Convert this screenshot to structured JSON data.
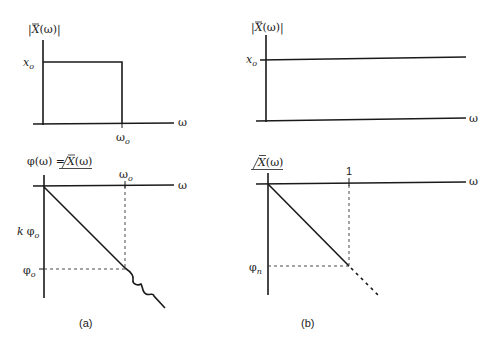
{
  "figure": {
    "panel_a": {
      "caption": "(a)",
      "magnitude_plot": {
        "ylabel": "|X̄(ω)|",
        "xlabel": "ω",
        "level_label_main": "x",
        "level_label_sub": "o",
        "cutoff_label_main": "ω",
        "cutoff_label_sub": "o",
        "shape": "rectangular pulse: |X̄(ω)| = x_o for 0 ≤ ω ≤ ω_o, 0 beyond"
      },
      "phase_plot": {
        "ylabel": "φ(ω) = ∠X̄(ω)",
        "ylabel_left": "φ(ω) = ",
        "ylabel_angle": "X̄(ω)",
        "xlabel": "ω",
        "cutoff_label_main": "ω",
        "cutoff_label_sub": "o",
        "k_phi_label_k": "k",
        "k_phi_label_main": "φ",
        "k_phi_label_sub": "o",
        "phi_label_main": "φ",
        "phi_label_sub": "o",
        "shape": "linear descent to φ_o at ω_o, then wavy continuation"
      }
    },
    "panel_b": {
      "caption": "(b)",
      "magnitude_plot": {
        "ylabel": "|X̄(ω)|",
        "xlabel": "ω",
        "level_label_main": "x",
        "level_label_sub": "o",
        "shape": "constant |X̄(ω)| = x_o for all ω"
      },
      "phase_plot": {
        "ylabel": "∠X̄(ω)",
        "ylabel_angle": "X̄(ω)",
        "xlabel": "ω",
        "tick_label": "1",
        "phi_label_main": "φ",
        "phi_label_sub": "n",
        "shape": "linear descent to φ_n at ω = 1, dashed continuation"
      }
    },
    "colors": {
      "ink": "#1a1a1a",
      "background": "#ffffff"
    }
  }
}
